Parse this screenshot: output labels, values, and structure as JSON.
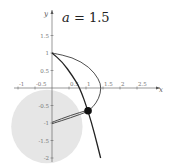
{
  "chart_data": {
    "type": "line",
    "title": "a = 1.5",
    "title_parts": {
      "var": "a",
      "eq": " = ",
      "value": "1.5"
    },
    "xlabel": "x",
    "ylabel": "y",
    "xlim": [
      -1,
      2.75
    ],
    "ylim": [
      -2,
      2
    ],
    "grid": false,
    "x_ticks": [
      {
        "value": -1,
        "label": "-1"
      },
      {
        "value": -0.5,
        "label": "-0.5"
      },
      {
        "value": 0.5,
        "label": "0.5"
      },
      {
        "value": 1,
        "label": "1"
      },
      {
        "value": 1.5,
        "label": "1.5"
      },
      {
        "value": 2,
        "label": "2"
      },
      {
        "value": 2.5,
        "label": "2.5"
      }
    ],
    "y_ticks": [
      {
        "value": 1.5,
        "label": "1.5"
      },
      {
        "value": 1,
        "label": "1"
      },
      {
        "value": 0.5,
        "label": "0.5"
      },
      {
        "value": -0.5,
        "label": "-0.5"
      },
      {
        "value": -1,
        "label": "-1"
      },
      {
        "value": -1.5,
        "label": "-1.5"
      },
      {
        "value": -2,
        "label": "-2"
      }
    ],
    "series": [
      {
        "name": "outer-arc",
        "description": "arc from (0,1) bulging to (1.5,0) and back to point",
        "points": [
          [
            0,
            1
          ],
          [
            0.6,
            0.88
          ],
          [
            1.1,
            0.6
          ],
          [
            1.38,
            0.25
          ],
          [
            1.45,
            0
          ],
          [
            1.38,
            -0.3
          ],
          [
            1.2,
            -0.55
          ],
          [
            1.06,
            -0.65
          ]
        ]
      },
      {
        "name": "steep-curve",
        "description": "curve from (0,1) down through the point to (1.45,-2)",
        "points": [
          [
            0,
            1
          ],
          [
            0.3,
            0.75
          ],
          [
            0.6,
            0.35
          ],
          [
            0.82,
            0
          ],
          [
            1.06,
            -0.65
          ],
          [
            1.25,
            -1.3
          ],
          [
            1.43,
            -2
          ]
        ]
      },
      {
        "name": "upper-chord",
        "points": [
          [
            0,
            -0.98
          ],
          [
            0.55,
            -0.78
          ],
          [
            1.06,
            -0.63
          ]
        ]
      },
      {
        "name": "lower-chord",
        "points": [
          [
            0,
            -1.02
          ],
          [
            0.55,
            -0.85
          ],
          [
            1.06,
            -0.67
          ]
        ]
      }
    ],
    "highlight_point": {
      "x": 1.06,
      "y": -0.65
    },
    "shaded_region": {
      "center": [
        -0.15,
        -1.1
      ],
      "rx": 1.05,
      "ry": 1.05,
      "color": "#e6e6e6"
    }
  },
  "colors": {
    "axis": "#555555",
    "curve": "#222222",
    "shade": "#e6e6e6",
    "dot": "#111111"
  }
}
